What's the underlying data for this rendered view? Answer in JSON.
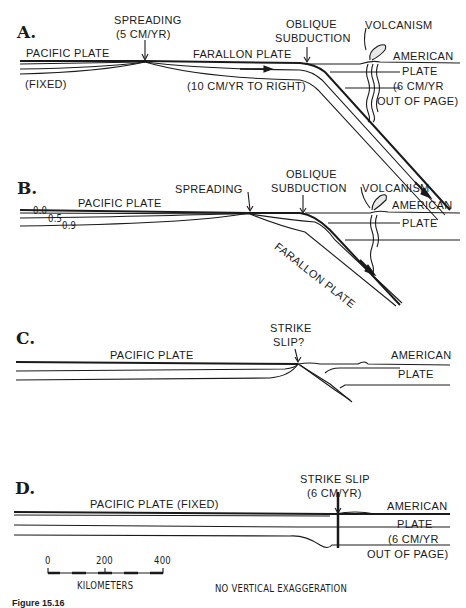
{
  "figure": {
    "caption": "Figure 15.16",
    "scale_bar": {
      "ticks": [
        "0",
        "200",
        "400"
      ],
      "unit": "KILOMETERS"
    },
    "note": "NO VERTICAL EXAGGERATION"
  },
  "panels": [
    {
      "letter": "A.",
      "labels": {
        "spreading": "SPREADING",
        "spreading_rate": "(5 CM/YR)",
        "pacific": "PACIFIC PLATE",
        "pacific_note": "(FIXED)",
        "farallon": "FARALLON PLATE",
        "farallon_rate": "(10 CM/YR TO RIGHT)",
        "oblique1": "OBLIQUE",
        "oblique2": "SUBDUCTION",
        "volcanism": "VOLCANISM",
        "american": "AMERICAN",
        "plate": "PLATE",
        "american_rate": "(6 CM/YR",
        "american_dir": "OUT OF PAGE)"
      }
    },
    {
      "letter": "B.",
      "labels": {
        "pacific": "PACIFIC PLATE",
        "spreading": "SPREADING",
        "oblique1": "OBLIQUE",
        "oblique2": "SUBDUCTION",
        "volcanism": "VOLCANISM",
        "american": "AMERICAN",
        "plate": "PLATE",
        "farallon": "FARALLON PLATE",
        "contour_0": "0.0",
        "contour_1": "0.5",
        "contour_2": "0.9"
      }
    },
    {
      "letter": "C.",
      "labels": {
        "strike1": "STRIKE",
        "strike2": "SLIP?",
        "pacific": "PACIFIC PLATE",
        "american": "AMERICAN",
        "plate": "PLATE"
      }
    },
    {
      "letter": "D.",
      "labels": {
        "strike1": "STRIKE SLIP",
        "strike2": "(6 CM/YR)",
        "pacific": "PACIFIC PLATE (FIXED)",
        "american": "AMERICAN",
        "plate": "PLATE",
        "american_rate": "(6 CM/YR",
        "american_dir": "OUT OF PAGE)"
      }
    }
  ],
  "colors": {
    "ink": "#1a1a1a",
    "paper": "#ffffff"
  }
}
